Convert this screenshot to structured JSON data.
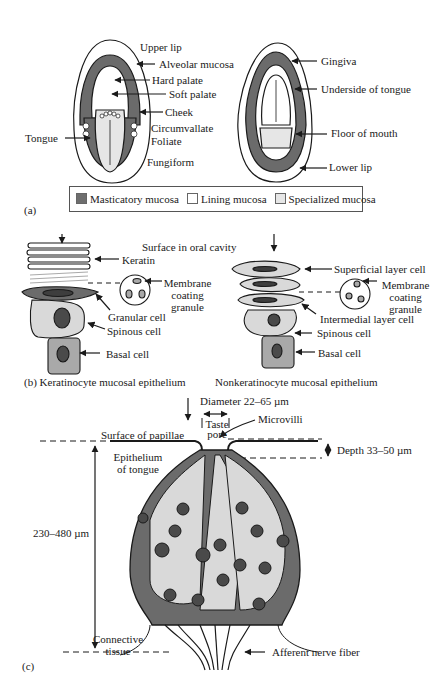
{
  "panel_a": {
    "label": "(a)",
    "left_mouth_labels": [
      "Upper lip",
      "Alveolar mucosa",
      "Hard palate",
      "Soft palate",
      "Cheek",
      "Circumvallate",
      "Foliate",
      "Fungiform",
      "Tongue"
    ],
    "right_mouth_labels": [
      "Gingiva",
      "Underside of tongue",
      "Floor of mouth",
      "Lower lip"
    ],
    "legend": [
      {
        "label": "Masticatory mucosa",
        "color": "#6e6e6e"
      },
      {
        "label": "Lining mucosa",
        "color": "#ffffff"
      },
      {
        "label": "Specialized mucosa",
        "color": "#e6e6e6"
      }
    ]
  },
  "panel_b": {
    "surface_label": "Surface in oral cavity",
    "keratinocyte": {
      "caption": "(b)  Keratinocyte mucosal epithelium",
      "labels": [
        "Keratin",
        "Membrane coating granule",
        "Granular cell",
        "Spinous cell",
        "Basal cell"
      ]
    },
    "nonkeratinocyte": {
      "caption": "Nonkeratinocyte mucosal epithelium",
      "labels": [
        "Superficial layer cell",
        "Membrane coating granule",
        "Intermedial layer cell",
        "Spinous cell",
        "Basal cell"
      ]
    }
  },
  "panel_c": {
    "label": "(c)",
    "diameter": "Diameter  22–65 µm",
    "taste_pore": "Taste pore",
    "microvilli": "Microvilli",
    "surface": "Surface of papillae",
    "depth": "Depth 33–50 µm",
    "epithelium": "Epithelium of tongue",
    "height": "230–480 µm",
    "connective": "Connective tissue",
    "nerve": "Afferent nerve fiber"
  },
  "colors": {
    "dark": "#6b6b6b",
    "mid": "#a9a9a9",
    "light": "#d9d9d9",
    "nucleus": "#4a4a4a",
    "line": "#1a1a1a"
  }
}
